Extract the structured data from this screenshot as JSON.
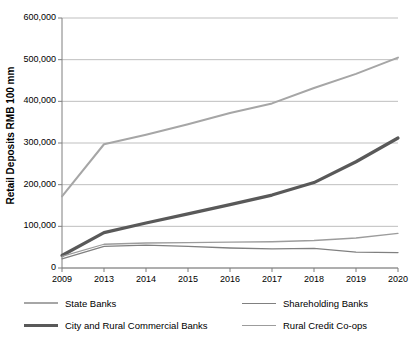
{
  "chart_data": {
    "type": "line",
    "title": "",
    "xlabel": "",
    "ylabel": "Retail Deposits RMB 100 mm",
    "x": [
      "2009",
      "2013",
      "2014",
      "2015",
      "2016",
      "2017",
      "2018",
      "2019",
      "2020"
    ],
    "ylim": [
      0,
      600000
    ],
    "yticks": [
      0,
      100000,
      200000,
      300000,
      400000,
      500000,
      600000
    ],
    "ytick_labels": [
      "0",
      "100,000",
      "200,000",
      "300,000",
      "400,000",
      "500,000",
      "600,000"
    ],
    "grid": true,
    "legend_position": "bottom",
    "series": [
      {
        "name": "State Banks",
        "color": "#a6a6a6",
        "width": 2,
        "values": [
          172000,
          297000,
          320000,
          345000,
          372000,
          395000,
          432000,
          466000,
          505000
        ]
      },
      {
        "name": "Shareholding Banks",
        "color": "#808080",
        "width": 1.3,
        "values": [
          22000,
          52000,
          55000,
          52000,
          48000,
          46000,
          47000,
          38000,
          37000
        ]
      },
      {
        "name": "City and Rural Commercial Banks",
        "color": "#595959",
        "width": 3.2,
        "values": [
          30000,
          85000,
          108000,
          130000,
          152000,
          175000,
          205000,
          255000,
          312000
        ]
      },
      {
        "name": "Rural Credit Co-ops",
        "color": "#9c9c9c",
        "width": 1.3,
        "values": [
          28000,
          57000,
          60000,
          61000,
          62000,
          63000,
          66000,
          72000,
          83000
        ]
      }
    ]
  },
  "axes": {
    "ytick_labels": [
      "600,000",
      "500,000",
      "400,000",
      "300,000",
      "200,000",
      "100,000",
      "0"
    ],
    "xtick_labels": [
      "2009",
      "2013",
      "2014",
      "2015",
      "2016",
      "2017",
      "2018",
      "2019",
      "2020"
    ],
    "ylabel": "Retail Deposits RMB 100 mm"
  },
  "legend": {
    "row1": [
      {
        "label": "State Banks",
        "color": "#a6a6a6",
        "width": 2
      },
      {
        "label": "Shareholding Banks",
        "color": "#808080",
        "width": 1.3
      }
    ],
    "row2": [
      {
        "label": "City and Rural Commercial Banks",
        "color": "#595959",
        "width": 3.2
      },
      {
        "label": "Rural Credit Co-ops",
        "color": "#9c9c9c",
        "width": 1.3
      }
    ]
  }
}
